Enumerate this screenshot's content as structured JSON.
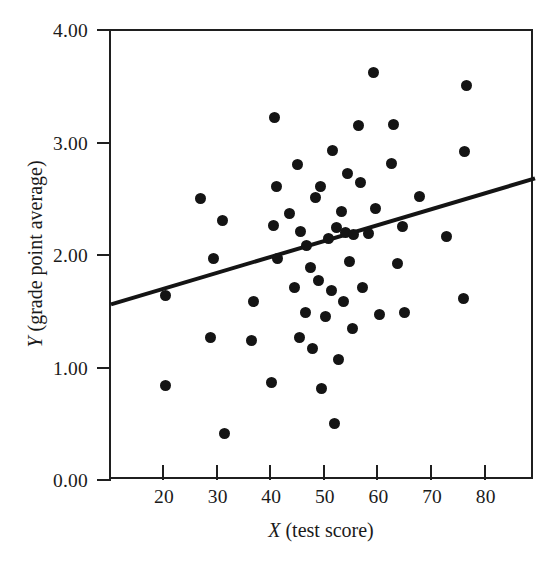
{
  "chart_data": {
    "type": "scatter",
    "title": "",
    "xlabel": "X (test score)",
    "ylabel": "Y (grade point average)",
    "xlabel_var": "X",
    "xlabel_rest": " (test score)",
    "ylabel_var": "Y",
    "ylabel_rest": " (grade point average)",
    "xlim": [
      10.1,
      89.2
    ],
    "ylim": [
      0.0,
      4.0
    ],
    "xticks": [
      20,
      30,
      40,
      50,
      60,
      70,
      80
    ],
    "xtick_labels": [
      "20",
      "30",
      "40",
      "50",
      "60",
      "70",
      "80"
    ],
    "yticks": [
      0.0,
      1.0,
      2.0,
      3.0,
      4.0
    ],
    "ytick_labels": [
      "0.00",
      "1.00",
      "2.00",
      "3.00",
      "4.00"
    ],
    "grid": false,
    "legend": "none",
    "marker": "filled-circle",
    "marker_color": "#141414",
    "frame_color": "#1f1f1f",
    "points": [
      [
        20.2,
        0.85
      ],
      [
        20.3,
        1.65
      ],
      [
        26.8,
        2.51
      ],
      [
        28.6,
        1.28
      ],
      [
        29.2,
        1.98
      ],
      [
        30.9,
        2.32
      ],
      [
        31.2,
        0.42
      ],
      [
        36.3,
        1.25
      ],
      [
        36.6,
        1.6
      ],
      [
        40.1,
        0.88
      ],
      [
        40.4,
        2.27
      ],
      [
        40.6,
        3.23
      ],
      [
        41.0,
        2.62
      ],
      [
        41.2,
        1.98
      ],
      [
        43.4,
        2.38
      ],
      [
        44.4,
        1.72
      ],
      [
        44.8,
        2.81
      ],
      [
        45.2,
        1.28
      ],
      [
        45.5,
        2.22
      ],
      [
        46.3,
        1.5
      ],
      [
        46.6,
        2.09
      ],
      [
        47.3,
        1.9
      ],
      [
        47.6,
        1.18
      ],
      [
        48.2,
        2.52
      ],
      [
        48.8,
        1.78
      ],
      [
        49.1,
        2.62
      ],
      [
        49.4,
        0.82
      ],
      [
        50.2,
        1.46
      ],
      [
        50.6,
        2.16
      ],
      [
        51.2,
        1.69
      ],
      [
        51.5,
        2.94
      ],
      [
        51.8,
        0.51
      ],
      [
        52.2,
        2.25
      ],
      [
        52.6,
        1.08
      ],
      [
        53.1,
        2.4
      ],
      [
        53.4,
        1.6
      ],
      [
        53.8,
        2.21
      ],
      [
        54.2,
        2.73
      ],
      [
        54.6,
        1.95
      ],
      [
        55.1,
        1.36
      ],
      [
        55.4,
        2.19
      ],
      [
        56.2,
        3.16
      ],
      [
        56.6,
        2.65
      ],
      [
        57.1,
        1.72
      ],
      [
        58.2,
        2.2
      ],
      [
        59.0,
        3.63
      ],
      [
        59.4,
        2.42
      ],
      [
        60.2,
        1.48
      ],
      [
        62.4,
        2.82
      ],
      [
        62.8,
        3.17
      ],
      [
        63.6,
        1.93
      ],
      [
        64.4,
        2.26
      ],
      [
        64.8,
        1.5
      ],
      [
        67.6,
        2.53
      ],
      [
        72.6,
        2.17
      ],
      [
        75.8,
        1.62
      ],
      [
        76.0,
        2.93
      ],
      [
        76.4,
        3.52
      ]
    ],
    "trendline": {
      "kind": "least-squares-regression",
      "x_start": 10.1,
      "y_start": 1.57,
      "x_end": 89.2,
      "y_end": 2.69,
      "color": "#141414",
      "width_px": 4
    }
  }
}
